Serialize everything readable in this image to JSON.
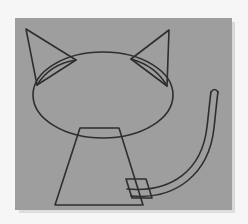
{
  "image": {
    "kind": "scanned-line-drawing",
    "subject": "cat",
    "width": 248,
    "height": 224,
    "outer_background_color": "#f6f6f6",
    "panel_background_color": "#9e9e9e",
    "ink_color": "#2e2e2e",
    "ghost_text": ""
  },
  "panel": {
    "x": 15,
    "y": 18,
    "width": 217,
    "height": 192,
    "shadow_color": "#cfcfcf"
  },
  "figure": {
    "label": "cat",
    "stroke_width": 1.6,
    "parts": [
      {
        "name": "head",
        "shape": "ellipse",
        "cx": 103,
        "cy": 95,
        "rx": 70,
        "ry": 43
      },
      {
        "name": "left-ear-outline",
        "shape": "triangle",
        "points": "26,29 76,60 37,85"
      },
      {
        "name": "left-ear-inner",
        "shape": "curve",
        "path": "M 76,60 Q 50,64 37,85"
      },
      {
        "name": "right-ear-outline",
        "shape": "triangle",
        "points": "169,30 131,59 167,86"
      },
      {
        "name": "right-ear-inner",
        "shape": "curve",
        "path": "M 131,59 Q 156,66 167,86"
      },
      {
        "name": "body",
        "shape": "trapezoid",
        "points": "80,128 119,128 143,205 55,205"
      },
      {
        "name": "tail-base",
        "shape": "quad",
        "points": "126,179 146,179 152,198 132,198"
      },
      {
        "name": "tail-outer",
        "shape": "curve",
        "path": "M 131,196 C 176,200 209,174 214,128 C 216,110 217,98 218,92"
      },
      {
        "name": "tail-inner",
        "shape": "curve",
        "path": "M 127,189 C 172,193 202,170 207,127 C 209,110 210,98 211,92"
      },
      {
        "name": "tail-tip",
        "shape": "arc",
        "path": "M 211,92 Q 214.5,87 218,92"
      }
    ]
  }
}
